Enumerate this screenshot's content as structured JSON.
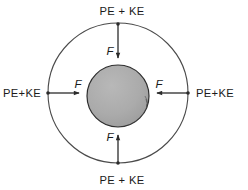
{
  "figure": {
    "background_color": "#ffffff",
    "line_color": "#2b2b2b",
    "text_color": "#1b1b1b"
  },
  "sphere": {
    "name": "central-sphere",
    "fill_color": "#a9a9a9",
    "shade_color": "#4a4a4a",
    "outline_color": "#2e2e2e",
    "center_x": 118,
    "center_y": 96,
    "radius": 31
  },
  "orbit": {
    "name": "orbit-circle",
    "center_x": 118,
    "center_y": 93,
    "radius": 70,
    "stroke_color": "#4a4a4a"
  },
  "labels": {
    "energy_top": "PE + KE",
    "energy_bottom": "PE + KE",
    "energy_left": "PE+KE",
    "energy_right": "PE+KE",
    "force_top": "F",
    "force_bottom": "F",
    "force_left": "F",
    "force_right": "F"
  },
  "arrows": [
    {
      "name": "force-arrow-top",
      "label": "F",
      "direction": "down",
      "from": "orbit-top",
      "to": "sphere-top"
    },
    {
      "name": "force-arrow-bottom",
      "label": "F",
      "direction": "up",
      "from": "orbit-bottom",
      "to": "sphere-bottom"
    },
    {
      "name": "force-arrow-left",
      "label": "F",
      "direction": "right",
      "from": "orbit-left",
      "to": "sphere-left"
    },
    {
      "name": "force-arrow-right",
      "label": "F",
      "direction": "left",
      "from": "orbit-right",
      "to": "sphere-right"
    }
  ],
  "markers": {
    "dot_color": "#2b2b2b",
    "dot_radius": 1.8,
    "positions": [
      "orbit-top",
      "orbit-bottom",
      "orbit-left",
      "orbit-right"
    ]
  }
}
